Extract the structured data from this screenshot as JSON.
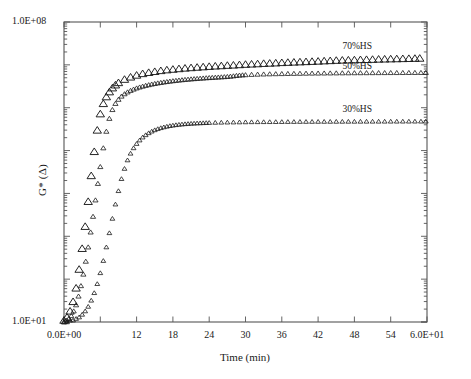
{
  "chart_data": {
    "type": "scatter",
    "title": "",
    "xlabel": "Time (min)",
    "ylabel": "G* (Δ)",
    "xlim": [
      0,
      60
    ],
    "ylim": [
      10,
      100000000
    ],
    "yscale": "log",
    "xscale": "linear",
    "grid": false,
    "legend_position": "inline-right",
    "frame": "box",
    "tick_direction": "in",
    "x_tick_labels": [
      "0.0E+00",
      "",
      "12",
      "18",
      "24",
      "30",
      "36",
      "42",
      "48",
      "54",
      "6.0E+01"
    ],
    "x_tick_values": [
      0,
      6,
      12,
      18,
      24,
      30,
      36,
      42,
      48,
      54,
      60
    ],
    "y_tick_labels_major": [
      "1.0E+01",
      "1.0E+08"
    ],
    "y_tick_values_major": [
      10,
      100000000
    ],
    "y_minor_ticks": true,
    "marker": "open-triangle",
    "marker_color": "#1a1a1a",
    "series": [
      {
        "name": "70%HS",
        "label": "70%HS",
        "marker_size": 4.2,
        "annotation_x": 48.5,
        "annotation_y": 26000000,
        "x": [
          0.0,
          0.5,
          1.0,
          1.5,
          2.0,
          2.5,
          3.0,
          3.5,
          4.0,
          4.5,
          5.0,
          5.5,
          6.0,
          6.5,
          7.0,
          7.5,
          8.0,
          8.5,
          9.0,
          10.0,
          11.0,
          12.0,
          13.0,
          14.0,
          15.0,
          16.0,
          17.0,
          18.0,
          19.0,
          20.0,
          21.0,
          22.0,
          23.0,
          24.0,
          25.0,
          26.0,
          27.0,
          28.0,
          29.0,
          30.0,
          31.0,
          32.0,
          33.0,
          34.0,
          35.0,
          36.0,
          37.0,
          38.0,
          39.0,
          40.0,
          41.0,
          42.0,
          43.0,
          44.0,
          45.0,
          46.0,
          47.0,
          48.0,
          49.0,
          50.0,
          51.0,
          52.0,
          53.0,
          54.0,
          55.0,
          56.0,
          57.0,
          58.0,
          58.8
        ],
        "y": [
          11,
          13,
          18,
          30,
          62,
          170,
          520,
          1700,
          6500,
          26000,
          95000,
          300000,
          720000,
          1250000,
          1800000,
          2350000,
          2900000,
          3400000,
          3850000,
          4600000,
          5200000,
          5750000,
          6250000,
          6650000,
          7000000,
          7350000,
          7650000,
          7900000,
          8150000,
          8400000,
          8600000,
          8800000,
          9000000,
          9200000,
          9400000,
          9550000,
          9750000,
          9900000,
          10100000,
          10300000,
          10450000,
          10600000,
          10800000,
          10950000,
          11100000,
          11300000,
          11450000,
          11600000,
          11750000,
          11900000,
          12050000,
          12200000,
          12400000,
          12550000,
          12750000,
          12900000,
          13000000,
          13100000,
          13250000,
          13350000,
          13450000,
          13600000,
          13700000,
          13800000,
          13900000,
          14000000,
          14100000,
          14200000,
          14300000
        ]
      },
      {
        "name": "50%HS",
        "label": "50%HS",
        "marker_size": 2.6,
        "annotation_x": 48.5,
        "annotation_y": 9000000,
        "x": [
          0.0,
          0.4,
          0.8,
          1.2,
          1.6,
          2.0,
          2.4,
          2.8,
          3.2,
          3.6,
          4.0,
          4.4,
          4.8,
          5.2,
          5.6,
          6.0,
          6.5,
          7.0,
          7.5,
          8.0,
          8.5,
          9.0,
          9.5,
          10.0,
          10.5,
          11.0,
          11.5,
          12.0,
          12.5,
          13.0,
          13.5,
          14.0,
          14.5,
          15.0,
          15.5,
          16.0,
          16.5,
          17.0,
          17.5,
          18.0,
          18.5,
          19.0,
          19.5,
          20.0,
          20.5,
          21.0,
          21.5,
          22.0,
          22.5,
          23.0,
          23.5,
          24.0,
          24.5,
          25.0,
          25.5,
          26.0,
          26.5,
          27.0,
          27.5,
          28.0,
          28.5,
          29.0,
          29.5,
          30.0,
          31.0,
          32.0,
          33.0,
          34.0,
          35.0,
          36.0,
          37.0,
          38.0,
          39.0,
          40.0,
          41.0,
          42.0,
          43.0,
          44.0,
          45.0,
          46.0,
          47.0,
          48.0,
          49.0,
          50.0,
          51.0,
          52.0,
          53.0,
          54.0,
          55.0,
          56.0,
          57.0,
          58.0,
          59.0,
          59.8
        ],
        "y": [
          10,
          11,
          12,
          14,
          18,
          25,
          40,
          70,
          130,
          260,
          560,
          1250,
          2900,
          7000,
          17000,
          42000,
          115000,
          280000,
          560000,
          900000,
          1250000,
          1560000,
          1850000,
          2100000,
          2320000,
          2520000,
          2700000,
          2870000,
          3020000,
          3160000,
          3300000,
          3420000,
          3540000,
          3650000,
          3760000,
          3860000,
          3960000,
          4050000,
          4140000,
          4230000,
          4310000,
          4390000,
          4460000,
          4540000,
          4600000,
          4670000,
          4730000,
          4790000,
          4850000,
          4900000,
          4960000,
          5010000,
          5060000,
          5110000,
          5160000,
          5210000,
          5260000,
          5320000,
          5400000,
          5500000,
          5620000,
          5720000,
          5800000,
          5850000,
          5950000,
          6020000,
          6080000,
          6130000,
          6170000,
          6210000,
          6250000,
          6280000,
          6310000,
          6340000,
          6370000,
          6390000,
          6410000,
          6430000,
          6450000,
          6470000,
          6480000,
          6500000,
          6510000,
          6520000,
          6530000,
          6540000,
          6550000,
          6560000,
          6570000,
          6580000,
          6590000,
          6600000,
          6600000,
          6610000
        ]
      },
      {
        "name": "30%HS",
        "label": "30%HS",
        "marker_size": 2.4,
        "annotation_x": 48.5,
        "annotation_y": 900000,
        "x": [
          0.0,
          0.5,
          1.0,
          1.5,
          2.0,
          2.5,
          3.0,
          3.5,
          4.0,
          4.5,
          5.0,
          5.5,
          6.0,
          6.5,
          7.0,
          7.5,
          8.0,
          8.5,
          9.0,
          9.5,
          10.0,
          10.5,
          11.0,
          11.5,
          12.0,
          12.5,
          13.0,
          13.5,
          14.0,
          14.5,
          15.0,
          15.5,
          16.0,
          16.5,
          17.0,
          17.5,
          18.0,
          18.5,
          19.0,
          19.5,
          20.0,
          20.5,
          21.0,
          21.5,
          22.0,
          22.5,
          23.0,
          23.5,
          24.0,
          25.0,
          26.0,
          27.0,
          28.0,
          29.0,
          30.0,
          31.0,
          32.0,
          33.0,
          34.0,
          35.0,
          36.0,
          37.0,
          38.0,
          39.0,
          40.0,
          41.0,
          42.0,
          43.0,
          44.0,
          45.0,
          46.0,
          47.0,
          48.0,
          49.0,
          50.0,
          51.0,
          52.0,
          53.0,
          54.0,
          55.0,
          56.0,
          57.0,
          58.0,
          59.0,
          59.8
        ],
        "y": [
          10,
          10,
          11,
          11,
          12,
          13,
          15,
          18,
          23,
          32,
          48,
          78,
          140,
          270,
          560,
          1200,
          2600,
          5600,
          11500,
          22000,
          38000,
          60000,
          86000,
          115000,
          145000,
          175000,
          205000,
          232000,
          258000,
          282000,
          303000,
          322000,
          339000,
          354000,
          367000,
          379000,
          389000,
          398000,
          406000,
          413000,
          419000,
          424000,
          429000,
          433000,
          437000,
          440000,
          443000,
          446000,
          448000,
          452000,
          455000,
          458000,
          460000,
          462000,
          464000,
          466000,
          467000,
          468000,
          469000,
          470000,
          471000,
          472000,
          473000,
          474000,
          474500,
          475000,
          475500,
          476000,
          476500,
          477000,
          477500,
          478000,
          478500,
          479000,
          479500,
          480000,
          480000,
          480500,
          481000,
          481000,
          481500,
          481500,
          482000,
          482000,
          482000
        ]
      }
    ]
  },
  "axis": {
    "y_top_label": "1.0E+08",
    "y_bottom_label": "1.0E+01",
    "x_left_label": "0.0E+00",
    "x_right_label": "6.0E+01",
    "x_title": "Time (min)",
    "y_title": "G* (Δ)"
  },
  "x_ticks": [
    {
      "value": 0,
      "label": "0.0E+00"
    },
    {
      "value": 6,
      "label": ""
    },
    {
      "value": 12,
      "label": "12"
    },
    {
      "value": 18,
      "label": "18"
    },
    {
      "value": 24,
      "label": "24"
    },
    {
      "value": 30,
      "label": "30"
    },
    {
      "value": 36,
      "label": "36"
    },
    {
      "value": 42,
      "label": "42"
    },
    {
      "value": 48,
      "label": "48"
    },
    {
      "value": 54,
      "label": "54"
    },
    {
      "value": 60,
      "label": "6.0E+01"
    }
  ],
  "series_labels": [
    {
      "name": "70%HS"
    },
    {
      "name": "50%HS"
    },
    {
      "name": "30%HS"
    }
  ],
  "colors": {
    "axis": "#555555",
    "marker": "#1a1a1a",
    "text": "#1a1a1a",
    "background": "#ffffff"
  }
}
